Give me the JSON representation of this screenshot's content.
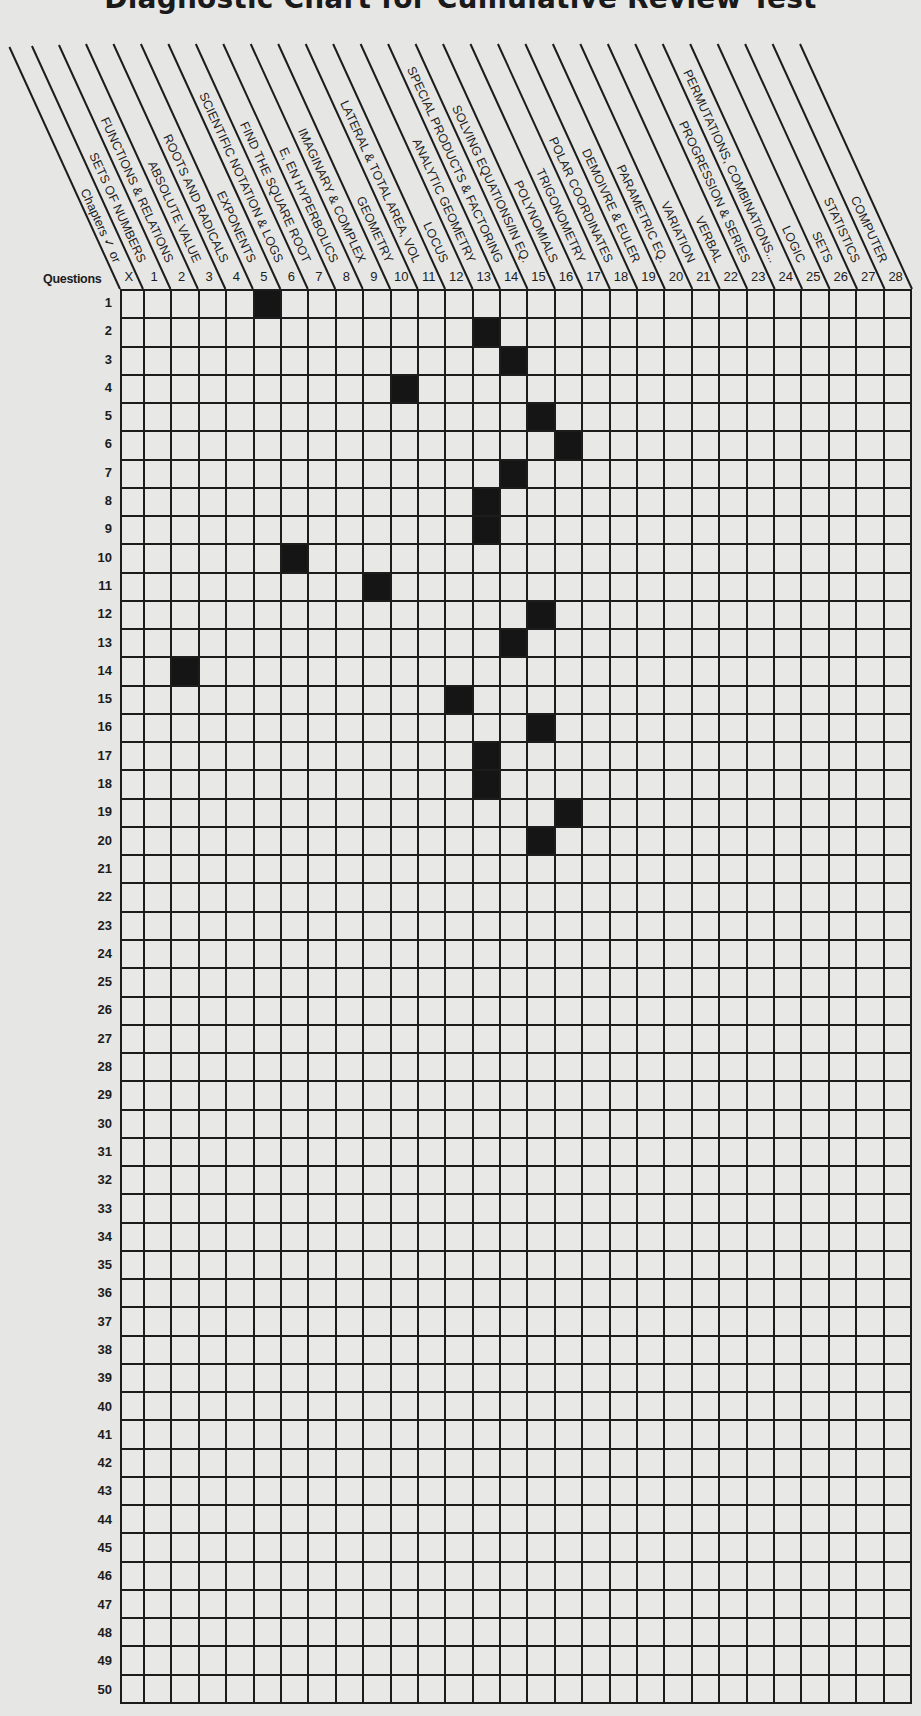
{
  "title": "Diagnostic Chart for Cumulative Review Test",
  "questions_label": "Questions",
  "columns": [
    {
      "num": "X",
      "label": "Chapters ✓ or"
    },
    {
      "num": "1",
      "label": "SETS OF NUMBERS"
    },
    {
      "num": "2",
      "label": "FUNCTIONS & RELATIONS"
    },
    {
      "num": "3",
      "label": "ABSOLUTE VALUE"
    },
    {
      "num": "4",
      "label": "ROOTS AND RADICALS"
    },
    {
      "num": "5",
      "label": "EXPONENTS"
    },
    {
      "num": "6",
      "label": "SCIENTIFIC NOTATION & LOGS"
    },
    {
      "num": "7",
      "label": "FIND THE SQUARE ROOT"
    },
    {
      "num": "8",
      "label": "E, EN HYPERBOLICS"
    },
    {
      "num": "9",
      "label": "IMAGINARY & COMPLEX"
    },
    {
      "num": "10",
      "label": "GEOMETRY"
    },
    {
      "num": "11",
      "label": "LATERAL & TOTAL AREA, VOL"
    },
    {
      "num": "12",
      "label": "LOCUS"
    },
    {
      "num": "13",
      "label": "ANALYTIC GEOMETRY"
    },
    {
      "num": "14",
      "label": "SPECIAL PRODUCTS & FACTORING"
    },
    {
      "num": "15",
      "label": "SOLVING EQUATIONS/IN EQ."
    },
    {
      "num": "16",
      "label": "POLYNOMIALS"
    },
    {
      "num": "17",
      "label": "TRIGONOMETRY"
    },
    {
      "num": "18",
      "label": "POLAR COORDINATES"
    },
    {
      "num": "19",
      "label": "DEMOIVRE & EULER"
    },
    {
      "num": "20",
      "label": "PARAMETRIC EQ."
    },
    {
      "num": "21",
      "label": "VARIATION"
    },
    {
      "num": "22",
      "label": "VERBAL"
    },
    {
      "num": "23",
      "label": "PROGRESSION & SERIES"
    },
    {
      "num": "24",
      "label": "PERMUTATIONS, COMBINATIONS..."
    },
    {
      "num": "25",
      "label": "LOGIC"
    },
    {
      "num": "26",
      "label": "SETS"
    },
    {
      "num": "27",
      "label": "STATISTICS"
    },
    {
      "num": "28",
      "label": "COMPUTER"
    }
  ],
  "colors": {
    "ink": "#1c1c1c",
    "filled": "#151515",
    "paper": "#e6e6e4"
  },
  "chart_data": {
    "type": "heatmap",
    "title": "Diagnostic Chart for Cumulative Review Test",
    "xlabel": "Chapters",
    "ylabel": "Questions",
    "x_categories": [
      "X",
      "1",
      "2",
      "3",
      "4",
      "5",
      "6",
      "7",
      "8",
      "9",
      "10",
      "11",
      "12",
      "13",
      "14",
      "15",
      "16",
      "17",
      "18",
      "19",
      "20",
      "21",
      "22",
      "23",
      "24",
      "25",
      "26",
      "27",
      "28"
    ],
    "y_categories": [
      1,
      2,
      3,
      4,
      5,
      6,
      7,
      8,
      9,
      10,
      11,
      12,
      13,
      14,
      15,
      16,
      17,
      18,
      19,
      20,
      21,
      22,
      23,
      24,
      25,
      26,
      27,
      28,
      29,
      30,
      31,
      32,
      33,
      34,
      35,
      36,
      37,
      38,
      39,
      40,
      41,
      42,
      43,
      44,
      45,
      46,
      47,
      48,
      49,
      50
    ],
    "question_to_chapter": {
      "1": 5,
      "2": 13,
      "3": 14,
      "4": 10,
      "5": 15,
      "6": 16,
      "7": 14,
      "8": 13,
      "9": 13,
      "10": 6,
      "11": 9,
      "12": 15,
      "13": 14,
      "14": 2,
      "15": 12,
      "16": 15,
      "17": 13,
      "18": 13,
      "19": 16,
      "20": 15
    },
    "grid": "on",
    "rows": 50,
    "cols": 29
  }
}
